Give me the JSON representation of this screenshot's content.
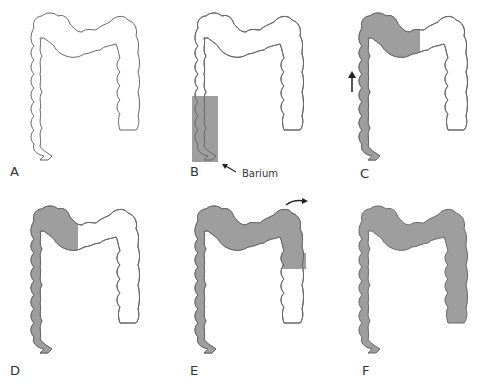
{
  "figure": {
    "fill_color": "#9e9e9e",
    "outline_color": "#555555",
    "panels": [
      {
        "label": "A",
        "state": "empty colon"
      },
      {
        "label": "B",
        "state": "barium fills rectum and sigmoid",
        "annotation": "Barium"
      },
      {
        "label": "C",
        "state": "barium ascends descending colon to splenic flexure",
        "arrow": "up"
      },
      {
        "label": "D",
        "state": "barium fills descending colon and left transverse colon"
      },
      {
        "label": "E",
        "state": "barium passes hepatic flexure into ascending colon",
        "arrow": "right-curved"
      },
      {
        "label": "F",
        "state": "entire colon filled"
      }
    ]
  }
}
